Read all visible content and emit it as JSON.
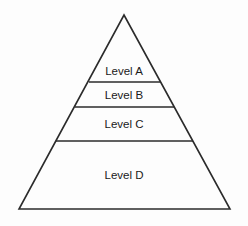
{
  "diagram": {
    "type": "pyramid",
    "background_color": "#fdfdfd",
    "outline_color": "#2b2b2b",
    "divider_color": "#2b2b2b",
    "label_color": "#1a1a1a",
    "fill_color": "none",
    "apex": {
      "x": 124,
      "y": 15
    },
    "base_left": {
      "x": 19,
      "y": 209
    },
    "base_right": {
      "x": 230,
      "y": 209
    },
    "tiers": [
      {
        "id": "tier-a",
        "label": "Level A",
        "order": 1,
        "position": "top",
        "label_x": 124,
        "label_y": 75,
        "divider_y": 82,
        "divider_x1": 89,
        "divider_x2": 160
      },
      {
        "id": "tier-b",
        "label": "Level B",
        "order": 2,
        "position": "upper-middle",
        "label_x": 124,
        "label_y": 99,
        "divider_y": 107,
        "divider_x1": 75,
        "divider_x2": 174
      },
      {
        "id": "tier-c",
        "label": "Level C",
        "order": 3,
        "position": "lower-middle",
        "label_x": 124,
        "label_y": 128,
        "divider_y": 141,
        "divider_x1": 56,
        "divider_x2": 193
      },
      {
        "id": "tier-d",
        "label": "Level D",
        "order": 4,
        "position": "base",
        "label_x": 124,
        "label_y": 179,
        "divider_y": null,
        "divider_x1": null,
        "divider_x2": null
      }
    ]
  }
}
